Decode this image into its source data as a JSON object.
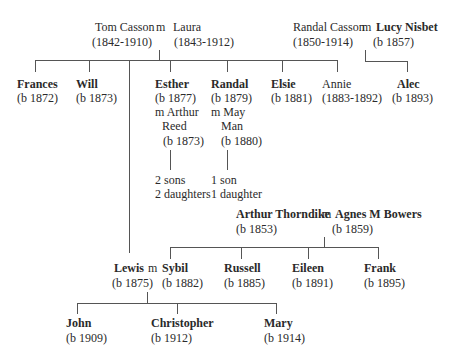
{
  "tree": {
    "tom_laura": {
      "husband": {
        "name": "Tom Casson",
        "dates": "(1842-1910)"
      },
      "marriage": "m",
      "wife": {
        "name": "Laura",
        "dates": "(1843-1912)"
      }
    },
    "randal_lucy": {
      "husband": {
        "name": "Randal Casson",
        "dates": "(1850-1914)"
      },
      "marriage": "m",
      "wife": {
        "name": "Lucy Nisbet",
        "dates": "(b 1857)"
      }
    },
    "casson_children": [
      {
        "name": "Frances",
        "dates": "(b 1872)"
      },
      {
        "name": "Will",
        "dates": "(b 1873)"
      },
      {
        "name": "Esther",
        "dates": "(b 1877)",
        "spouse_line1": "m Arthur",
        "spouse_line2": "Reed",
        "spouse_dates": "(b 1873)",
        "issue_line1": "2 sons",
        "issue_line2": "2 daughters"
      },
      {
        "name": "Randal",
        "dates": "(b 1879)",
        "spouse_line1": "m May",
        "spouse_line2": "Man",
        "spouse_dates": "(b 1880)",
        "issue_line1": "1 son",
        "issue_line2": "1 daughter"
      },
      {
        "name": "Elsie",
        "dates": "(b 1881)"
      },
      {
        "name": "Annie",
        "dates": "(1883-1892)"
      }
    ],
    "alec": {
      "name": "Alec",
      "dates": "(b 1893)"
    },
    "thorndike": {
      "husband": {
        "name": "Arthur Thorndike",
        "dates": "(b 1853)"
      },
      "marriage": "m",
      "wife": {
        "name": "Agnes M Bowers",
        "dates": "(b 1859)"
      }
    },
    "lewis_sybil": {
      "husband": {
        "name": "Lewis",
        "dates": "(b 1875)"
      },
      "marriage": "m",
      "wife": {
        "name": "Sybil",
        "dates": "(b 1882)"
      }
    },
    "thorndike_children": [
      {
        "name": "Russell",
        "dates": "(b 1885)"
      },
      {
        "name": "Eileen",
        "dates": "(b 1891)"
      },
      {
        "name": "Frank",
        "dates": "(b 1895)"
      }
    ],
    "lewis_children": [
      {
        "name": "John",
        "dates": "(b 1909)"
      },
      {
        "name": "Christopher",
        "dates": "(b 1912)"
      },
      {
        "name": "Mary",
        "dates": "(b 1914)"
      }
    ]
  }
}
